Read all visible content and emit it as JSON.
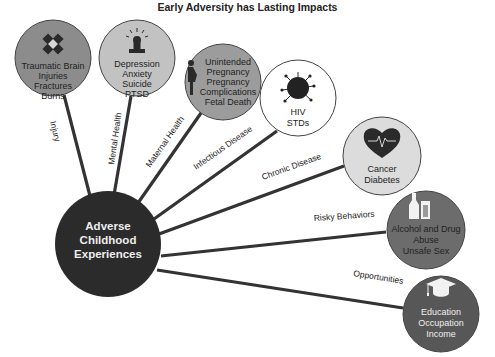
{
  "title": "Early Adversity has Lasting Impacts",
  "center": {
    "lines": [
      "Adverse",
      "Childhood",
      "Experiences"
    ],
    "fill": "#2b2b2b"
  },
  "outcomes": [
    {
      "category": "Injury",
      "icon": "bandage-icon",
      "lines": [
        "Traumatic Brain",
        "Injuries",
        "Fractures",
        "Burns"
      ],
      "fill": "#8c8c8c"
    },
    {
      "category": "Mental Health",
      "icon": "person-alarm-icon",
      "lines": [
        "Depression",
        "Anxiety",
        "Suicide",
        "PTSD"
      ],
      "fill": "#c2c2c2"
    },
    {
      "category": "Maternal Health",
      "icon": "pregnant-woman-icon",
      "lines": [
        "Unintended",
        "Pregnancy",
        "Pregnancy",
        "Complications",
        "Fetal Death"
      ],
      "fill": "#9c9c9c"
    },
    {
      "category": "Infectious Disease",
      "icon": "virus-icon",
      "lines": [
        "HIV",
        "STDs"
      ],
      "fill": "#ffffff"
    },
    {
      "category": "Chronic Disease",
      "icon": "heart-pulse-icon",
      "lines": [
        "Cancer",
        "Diabetes"
      ],
      "fill": "#dcdcdc"
    },
    {
      "category": "Risky Behaviors",
      "icon": "bottle-glass-icon",
      "lines": [
        "Alcohol and Drug",
        "Abuse",
        "Unsafe Sex"
      ],
      "fill": "#6c6c6c"
    },
    {
      "category": "Opportunities",
      "icon": "graduation-cap-icon",
      "lines": [
        "Education",
        "Occupation",
        "Income"
      ],
      "fill": "#575757"
    }
  ]
}
